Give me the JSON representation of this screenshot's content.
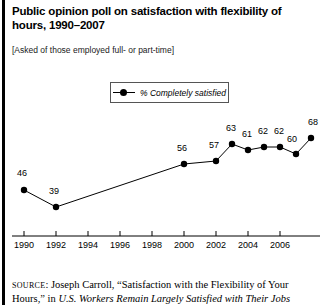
{
  "figure": {
    "title": "Public opinion poll on satisfaction with flexibility of hours, 1990–2007",
    "subtitle": "[Asked of those employed full- or part-time]"
  },
  "legend": {
    "label": "% Completely satisfied",
    "marker": "line-dot-marker"
  },
  "source": {
    "prefix": "SOURCE",
    "separator": ": ",
    "author_and_title": "Joseph Carroll, “Satisfaction with the Flexibility of Your Hours,” in ",
    "publication": "U.S. Workers Remain Largely Satisfied with Their Jobs"
  },
  "chart_data": {
    "type": "line",
    "title": "Public opinion poll on satisfaction with flexibility of hours, 1990–2007",
    "subtitle": "[Asked of those employed full- or part-time]",
    "xlabel": "",
    "ylabel": "",
    "legend_position": "top-center",
    "grid": false,
    "xlim": [
      1989.5,
      2007.5
    ],
    "ylim": [
      30,
      72
    ],
    "x_ticks": [
      "1990",
      "1992",
      "1994",
      "1996",
      "1998",
      "2000",
      "2002",
      "2004",
      "2006"
    ],
    "x_tick_values": [
      1990,
      1992,
      1994,
      1996,
      1998,
      2000,
      2002,
      2004,
      2006
    ],
    "series": [
      {
        "name": "% Completely satisfied",
        "x": [
          1990,
          1991,
          2000,
          2002,
          2003,
          2004,
          2005,
          2006,
          2007,
          2008
        ],
        "values": [
          46,
          39,
          56,
          57,
          63,
          61,
          62,
          62,
          60,
          68
        ],
        "point_labels": [
          "46",
          "39",
          "56",
          "57",
          "63",
          "61",
          "62",
          "62",
          "60",
          "68"
        ]
      }
    ]
  },
  "points": [
    {
      "label": "46",
      "px": 24,
      "py": 82,
      "lx": 22,
      "ly": 68
    },
    {
      "label": "39",
      "px": 56,
      "py": 99,
      "lx": 54,
      "ly": 86
    },
    {
      "label": "56",
      "px": 184,
      "py": 56,
      "lx": 182,
      "ly": 43
    },
    {
      "label": "57",
      "px": 216,
      "py": 53,
      "lx": 214,
      "ly": 40
    },
    {
      "label": "63",
      "px": 232,
      "py": 36,
      "lx": 231,
      "ly": 23
    },
    {
      "label": "61",
      "px": 248,
      "py": 42,
      "lx": 247,
      "ly": 29
    },
    {
      "label": "62",
      "px": 264,
      "py": 39,
      "lx": 263,
      "ly": 26
    },
    {
      "label": "62",
      "px": 280,
      "py": 39,
      "lx": 279,
      "ly": 26
    },
    {
      "label": "60",
      "px": 296,
      "py": 46,
      "lx": 292,
      "ly": 34
    },
    {
      "label": "68",
      "px": 311,
      "py": 30,
      "lx": 313,
      "ly": 17
    }
  ],
  "x_axis": {
    "ticks": [
      {
        "label": "1990",
        "x": 24
      },
      {
        "label": "1992",
        "x": 56
      },
      {
        "label": "1994",
        "x": 88
      },
      {
        "label": "1996",
        "x": 120
      },
      {
        "label": "1998",
        "x": 152
      },
      {
        "label": "2000",
        "x": 184
      },
      {
        "label": "2002",
        "x": 216
      },
      {
        "label": "2004",
        "x": 248
      },
      {
        "label": "2006",
        "x": 280
      }
    ]
  }
}
